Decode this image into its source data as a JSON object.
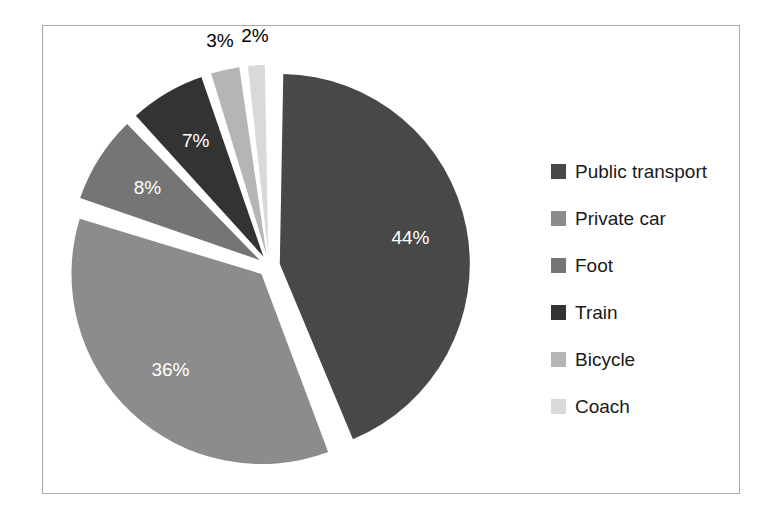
{
  "chart_data": {
    "type": "pie",
    "title": "",
    "exploded": true,
    "start_angle_deg": 0,
    "direction": "clockwise",
    "categories": [
      "Public transport",
      "Private car",
      "Foot",
      "Train",
      "Bicycle",
      "Coach"
    ],
    "values": [
      44,
      36,
      8,
      7,
      3,
      2
    ],
    "value_unit": "%",
    "data_labels": [
      "44%",
      "36%",
      "8%",
      "7%",
      "3%",
      "2%"
    ],
    "label_text_colors": [
      "#ffffff",
      "#ffffff",
      "#ffffff",
      "#ffffff",
      "#000000",
      "#000000"
    ],
    "label_placement": [
      "inside",
      "inside",
      "inside",
      "inside",
      "outside",
      "outside"
    ],
    "slice_colors": [
      "#484848",
      "#8c8c8c",
      "#757575",
      "#333333",
      "#b5b5b5",
      "#d9d9d9"
    ],
    "legend": {
      "position": "right",
      "entries": [
        {
          "label": "Public transport",
          "color": "#484848",
          "value": 44
        },
        {
          "label": "Private car",
          "color": "#8c8c8c",
          "value": 36
        },
        {
          "label": "Foot",
          "color": "#757575",
          "value": 8
        },
        {
          "label": "Train",
          "color": "#333333",
          "value": 7
        },
        {
          "label": "Bicycle",
          "color": "#b5b5b5",
          "value": 3
        },
        {
          "label": "Coach",
          "color": "#d9d9d9",
          "value": 2
        }
      ]
    },
    "xlabel": "",
    "ylabel": "",
    "grid": false
  },
  "frame": {
    "border_color": "#a9a9a9",
    "background": "#ffffff"
  }
}
